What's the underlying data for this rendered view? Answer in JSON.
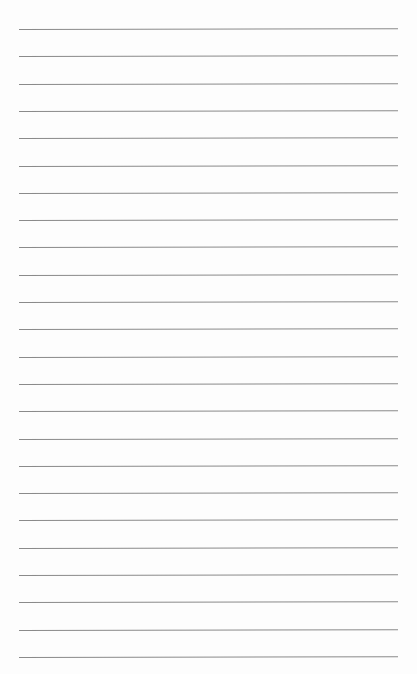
{
  "page": {
    "type": "lined-paper",
    "line_count": 24,
    "first_line_y": 29,
    "line_spacing": 27.3,
    "line_left": 19,
    "line_width": 379,
    "line_color": "#8a8a8a",
    "background_color": "#fdfdfd"
  },
  "content": {
    "written_text": []
  }
}
